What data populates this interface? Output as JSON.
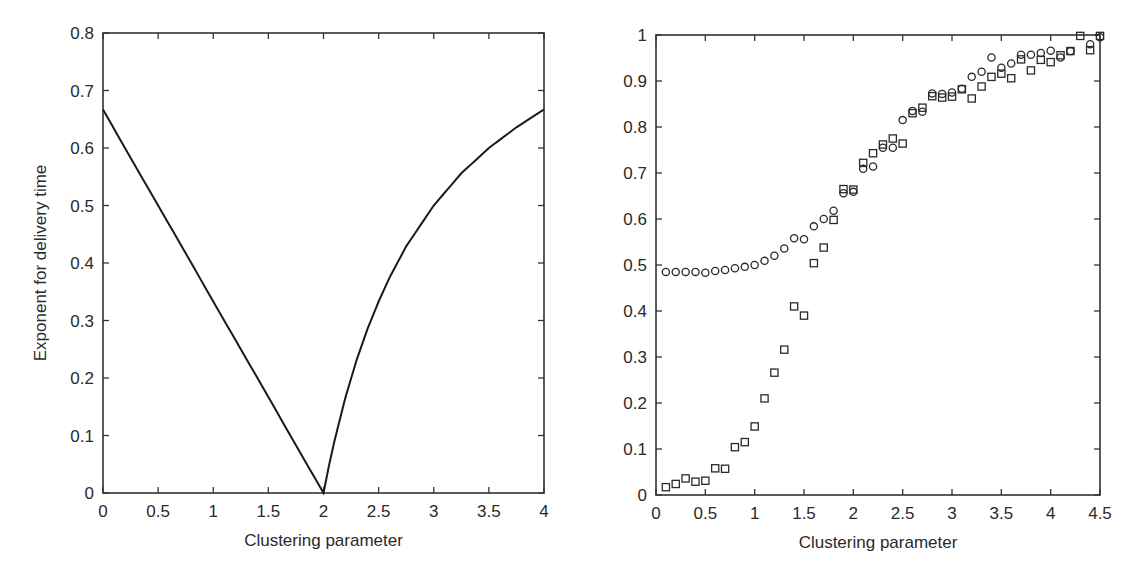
{
  "chart_data": [
    {
      "type": "line",
      "title": "",
      "xlabel": "Clustering parameter",
      "ylabel": "Exponent for delivery time",
      "xlim": [
        0,
        4
      ],
      "ylim": [
        0,
        0.8
      ],
      "xticks": [
        "0",
        "0.5",
        "1",
        "1.5",
        "2",
        "2.5",
        "3",
        "3.5",
        "4"
      ],
      "yticks": [
        "0",
        "0.1",
        "0.2",
        "0.3",
        "0.4",
        "0.5",
        "0.6",
        "0.7",
        "0.8"
      ],
      "grid": false,
      "legend": null,
      "series": [
        {
          "name": "exponent",
          "x": [
            0,
            0.25,
            0.5,
            0.75,
            1.0,
            1.25,
            1.5,
            1.75,
            2.0,
            2.05,
            2.1,
            2.2,
            2.3,
            2.4,
            2.5,
            2.6,
            2.75,
            3.0,
            3.25,
            3.5,
            3.75,
            4.0
          ],
          "values": [
            0.667,
            0.583,
            0.5,
            0.417,
            0.333,
            0.25,
            0.167,
            0.083,
            0.0,
            0.048,
            0.091,
            0.167,
            0.231,
            0.286,
            0.333,
            0.375,
            0.429,
            0.5,
            0.556,
            0.6,
            0.636,
            0.667
          ]
        }
      ]
    },
    {
      "type": "scatter",
      "title": "",
      "xlabel": "Clustering parameter",
      "ylabel": "",
      "xlim": [
        0,
        4.5
      ],
      "ylim": [
        0,
        1
      ],
      "xticks": [
        "0",
        "0.5",
        "1",
        "1.5",
        "2",
        "2.5",
        "3",
        "3.5",
        "4",
        "4.5"
      ],
      "yticks": [
        "0",
        "0.1",
        "0.2",
        "0.3",
        "0.4",
        "0.5",
        "0.6",
        "0.7",
        "0.8",
        "0.9",
        "1"
      ],
      "grid": false,
      "legend": null,
      "series": [
        {
          "name": "circles",
          "marker": "circle",
          "x": [
            0.1,
            0.2,
            0.3,
            0.4,
            0.5,
            0.6,
            0.7,
            0.8,
            0.9,
            1.0,
            1.1,
            1.2,
            1.3,
            1.4,
            1.5,
            1.6,
            1.7,
            1.8,
            1.9,
            2.0,
            2.1,
            2.2,
            2.3,
            2.4,
            2.5,
            2.6,
            2.7,
            2.8,
            2.9,
            3.0,
            3.1,
            3.2,
            3.3,
            3.4,
            3.5,
            3.6,
            3.7,
            3.8,
            3.9,
            4.0,
            4.1,
            4.2,
            4.4,
            4.5
          ],
          "values": [
            0.485,
            0.485,
            0.485,
            0.485,
            0.483,
            0.487,
            0.489,
            0.493,
            0.496,
            0.5,
            0.509,
            0.52,
            0.536,
            0.558,
            0.556,
            0.584,
            0.6,
            0.618,
            0.656,
            0.659,
            0.709,
            0.714,
            0.755,
            0.755,
            0.815,
            0.835,
            0.833,
            0.873,
            0.872,
            0.875,
            0.883,
            0.909,
            0.92,
            0.951,
            0.929,
            0.938,
            0.957,
            0.957,
            0.961,
            0.966,
            0.951,
            0.965,
            0.98,
            0.995
          ]
        },
        {
          "name": "squares",
          "marker": "square",
          "x": [
            0.1,
            0.2,
            0.3,
            0.4,
            0.5,
            0.6,
            0.7,
            0.8,
            0.9,
            1.0,
            1.1,
            1.2,
            1.3,
            1.4,
            1.5,
            1.6,
            1.7,
            1.8,
            1.9,
            2.0,
            2.1,
            2.2,
            2.3,
            2.4,
            2.5,
            2.6,
            2.7,
            2.8,
            2.9,
            3.0,
            3.1,
            3.2,
            3.3,
            3.4,
            3.5,
            3.6,
            3.7,
            3.8,
            3.9,
            4.0,
            4.1,
            4.2,
            4.3,
            4.4,
            4.5
          ],
          "values": [
            0.017,
            0.024,
            0.036,
            0.029,
            0.031,
            0.058,
            0.057,
            0.104,
            0.115,
            0.149,
            0.21,
            0.266,
            0.316,
            0.41,
            0.39,
            0.504,
            0.538,
            0.598,
            0.665,
            0.664,
            0.722,
            0.743,
            0.762,
            0.775,
            0.764,
            0.83,
            0.842,
            0.867,
            0.864,
            0.866,
            0.882,
            0.862,
            0.888,
            0.909,
            0.916,
            0.906,
            0.947,
            0.923,
            0.946,
            0.941,
            0.956,
            0.965,
            0.998,
            0.967,
            0.998
          ]
        }
      ]
    }
  ],
  "layout": {
    "left_panel": {
      "x0": 103,
      "x1": 544,
      "y0": 493,
      "y1": 33
    },
    "right_panel": {
      "x0": 656,
      "x1": 1100,
      "y0": 495,
      "y1": 35
    }
  }
}
